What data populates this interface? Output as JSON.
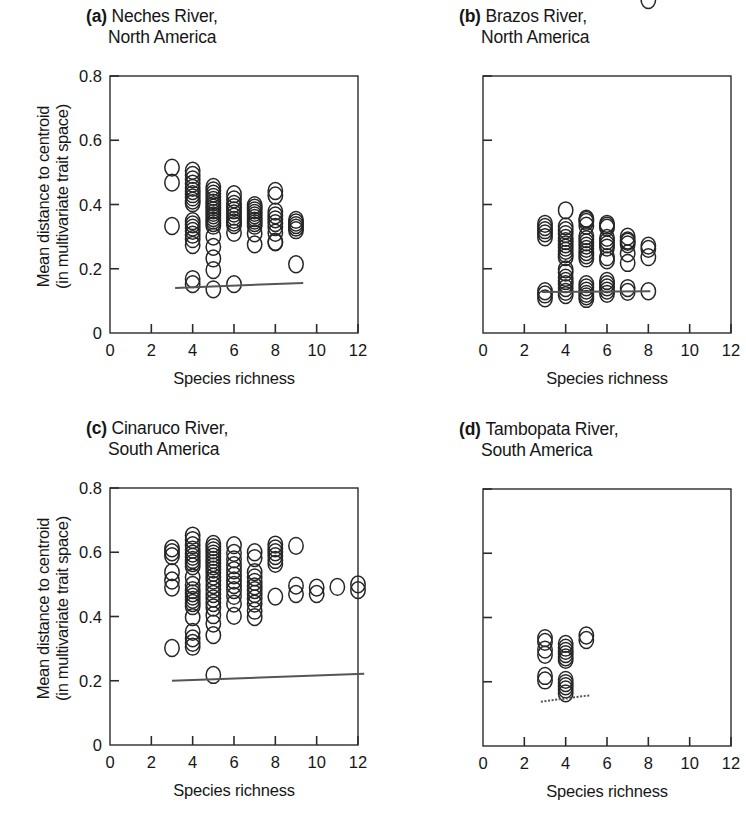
{
  "figure": {
    "width": 746,
    "height": 825,
    "background": "#ffffff",
    "marker": "open-circle",
    "marker_color": "#262626",
    "line_color": "#555555"
  },
  "axes": {
    "x_label": "Species richness",
    "y_label_line1": "Mean distance to centroid",
    "y_label_line2": "(in multivariate trait space)",
    "x_ticks": [
      "0",
      "2",
      "4",
      "6",
      "8",
      "10",
      "12"
    ],
    "x_tick_values": [
      0,
      2,
      4,
      6,
      8,
      10,
      12
    ],
    "y_ticks": [
      "0",
      "0.2",
      "0.4",
      "0.6",
      "0.8"
    ],
    "y_tick_values": [
      0,
      0.2,
      0.4,
      0.6,
      0.8
    ],
    "xlim": [
      0,
      12
    ],
    "ylim": [
      0,
      0.8
    ],
    "grid": false
  },
  "chart_data": [
    {
      "type": "scatter",
      "panel": "a",
      "panel_letter": "(a)",
      "title_line1": "Neches River,",
      "title_line2": "North America",
      "title": "(a) Neches River, North America",
      "xlabel": "Species richness",
      "ylabel": "Mean distance to centroid (in multivariate trait space)",
      "xlim": [
        0,
        12
      ],
      "ylim": [
        0,
        0.8
      ],
      "legend": null,
      "x": [
        3,
        3,
        3,
        4,
        4,
        4,
        4,
        4,
        4,
        4,
        4,
        4,
        4,
        4,
        4,
        4,
        4,
        4,
        4,
        4,
        4,
        4,
        5,
        5,
        5,
        5,
        5,
        5,
        5,
        5,
        5,
        5,
        5,
        5,
        5,
        5,
        5,
        5,
        5,
        5,
        5,
        5,
        6,
        6,
        6,
        6,
        6,
        6,
        6,
        6,
        6,
        6,
        6,
        6,
        7,
        7,
        7,
        7,
        7,
        7,
        7,
        7,
        7,
        7,
        7,
        8,
        8,
        8,
        8,
        8,
        8,
        8,
        8,
        8,
        8,
        9,
        9,
        9,
        9,
        9,
        9
      ],
      "y": [
        0.515,
        0.468,
        0.333,
        0.505,
        0.492,
        0.478,
        0.465,
        0.452,
        0.442,
        0.432,
        0.422,
        0.412,
        0.404,
        0.348,
        0.338,
        0.328,
        0.318,
        0.306,
        0.292,
        0.274,
        0.168,
        0.152,
        0.136,
        0.455,
        0.444,
        0.434,
        0.424,
        0.414,
        0.406,
        0.398,
        0.39,
        0.382,
        0.374,
        0.366,
        0.358,
        0.35,
        0.342,
        0.334,
        0.3,
        0.268,
        0.232,
        0.196,
        0.152,
        0.432,
        0.416,
        0.402,
        0.392,
        0.382,
        0.372,
        0.362,
        0.352,
        0.344,
        0.336,
        0.312,
        0.276,
        0.398,
        0.39,
        0.382,
        0.374,
        0.366,
        0.358,
        0.35,
        0.342,
        0.334,
        0.31,
        0.284,
        0.442,
        0.428,
        0.378,
        0.366,
        0.354,
        0.342,
        0.33,
        0.312,
        0.282,
        0.214,
        0.352,
        0.344,
        0.336,
        0.328,
        0.32,
        0.308
      ],
      "trend_line": {
        "x0": 3.15,
        "y0": 0.14,
        "x1": 9.35,
        "y1": 0.156,
        "style": "solid"
      }
    },
    {
      "type": "scatter",
      "panel": "b",
      "panel_letter": "(b)",
      "title_line1": "Brazos River,",
      "title_line2": "North America",
      "title": "(b) Brazos River, North America",
      "xlabel": "Species richness",
      "ylabel": "Mean distance to centroid (in multivariate trait space)",
      "xlim": [
        0,
        12
      ],
      "ylim": [
        0,
        0.8
      ],
      "legend": null,
      "x": [
        3,
        3,
        3,
        3,
        3,
        3,
        3,
        3,
        4,
        4,
        4,
        4,
        4,
        4,
        4,
        4,
        4,
        4,
        4,
        4,
        4,
        4,
        4,
        4,
        4,
        4,
        4,
        5,
        5,
        5,
        5,
        5,
        5,
        5,
        5,
        5,
        5,
        5,
        5,
        5,
        5,
        5,
        5,
        5,
        5,
        6,
        6,
        6,
        6,
        6,
        6,
        6,
        6,
        6,
        6,
        6,
        6,
        6,
        6,
        7,
        7,
        7,
        7,
        7,
        7,
        7,
        7,
        8,
        8,
        8,
        8,
        8
      ],
      "y": [
        0.34,
        0.33,
        0.32,
        0.31,
        0.298,
        0.13,
        0.12,
        0.108,
        0.382,
        0.332,
        0.32,
        0.308,
        0.296,
        0.286,
        0.276,
        0.266,
        0.256,
        0.246,
        0.236,
        0.198,
        0.188,
        0.172,
        0.162,
        0.152,
        0.14,
        0.128,
        0.118,
        0.356,
        0.346,
        0.334,
        0.302,
        0.292,
        0.282,
        0.272,
        0.262,
        0.252,
        0.242,
        0.232,
        0.152,
        0.142,
        0.132,
        0.122,
        0.114,
        0.106,
        0.352,
        0.34,
        0.328,
        0.296,
        0.286,
        0.276,
        0.266,
        0.236,
        0.226,
        0.162,
        0.152,
        0.142,
        0.132,
        0.122,
        0.334,
        0.3,
        0.288,
        0.276,
        0.248,
        0.218,
        0.14,
        0.128,
        0.284,
        0.272,
        0.262,
        0.236,
        0.13
      ],
      "trend_line": {
        "x0": 2.85,
        "y0": 0.128,
        "x1": 8.1,
        "y1": 0.13,
        "style": "solid"
      }
    },
    {
      "type": "scatter",
      "panel": "c",
      "panel_letter": "(c)",
      "title_line1": "Cinaruco River,",
      "title_line2": "South America",
      "title": "(c) Cinaruco River, South America",
      "xlabel": "Species richness",
      "ylabel": "Mean distance to centroid (in multivariate trait space)",
      "xlim": [
        0,
        12
      ],
      "ylim": [
        0,
        0.8
      ],
      "legend": null,
      "x": [
        3,
        3,
        3,
        3,
        3,
        3,
        3,
        4,
        4,
        4,
        4,
        4,
        4,
        4,
        4,
        4,
        4,
        4,
        4,
        4,
        4,
        4,
        4,
        4,
        4,
        4,
        4,
        4,
        4,
        5,
        5,
        5,
        5,
        5,
        5,
        5,
        5,
        5,
        5,
        5,
        5,
        5,
        5,
        5,
        5,
        5,
        5,
        5,
        5,
        5,
        5,
        6,
        6,
        6,
        6,
        6,
        6,
        6,
        6,
        6,
        6,
        6,
        6,
        7,
        7,
        7,
        7,
        7,
        7,
        7,
        7,
        7,
        7,
        7,
        7,
        8,
        8,
        8,
        8,
        8,
        8,
        8,
        9,
        9,
        9,
        10,
        10,
        11,
        12,
        12
      ],
      "y": [
        0.612,
        0.6,
        0.588,
        0.538,
        0.512,
        0.49,
        0.302,
        0.652,
        0.622,
        0.608,
        0.596,
        0.586,
        0.576,
        0.566,
        0.556,
        0.522,
        0.498,
        0.482,
        0.472,
        0.462,
        0.452,
        0.442,
        0.432,
        0.398,
        0.352,
        0.332,
        0.318,
        0.306,
        0.638,
        0.626,
        0.616,
        0.606,
        0.596,
        0.586,
        0.576,
        0.566,
        0.556,
        0.546,
        0.536,
        0.524,
        0.512,
        0.498,
        0.484,
        0.47,
        0.456,
        0.442,
        0.428,
        0.404,
        0.378,
        0.342,
        0.218,
        0.622,
        0.598,
        0.578,
        0.56,
        0.544,
        0.528,
        0.512,
        0.498,
        0.482,
        0.464,
        0.44,
        0.402,
        0.6,
        0.582,
        0.538,
        0.522,
        0.508,
        0.494,
        0.482,
        0.47,
        0.456,
        0.44,
        0.418,
        0.398,
        0.624,
        0.612,
        0.6,
        0.588,
        0.576,
        0.564,
        0.462,
        0.62,
        0.496,
        0.47,
        0.49,
        0.47,
        0.492,
        0.5,
        0.482
      ],
      "trend_line": {
        "x0": 3.0,
        "y0": 0.2,
        "x1": 12.3,
        "y1": 0.222,
        "style": "solid"
      }
    },
    {
      "type": "scatter",
      "panel": "d",
      "panel_letter": "(d)",
      "title_line1": "Tambopata River,",
      "title_line2": "South America",
      "title": "(d) Tambopata River, South America",
      "xlabel": "Species richness",
      "ylabel": "Mean distance to centroid (in multivariate trait space)",
      "xlim": [
        0,
        12
      ],
      "ylim": [
        0,
        0.8
      ],
      "legend": null,
      "x": [
        3,
        3,
        3,
        3,
        3,
        3,
        4,
        4,
        4,
        4,
        4,
        4,
        4,
        4,
        4,
        4,
        4,
        5,
        5
      ],
      "y": [
        0.336,
        0.324,
        0.3,
        0.284,
        0.218,
        0.204,
        0.318,
        0.306,
        0.296,
        0.286,
        0.276,
        0.268,
        0.206,
        0.196,
        0.186,
        0.176,
        0.164,
        0.344,
        0.33
      ],
      "trend_line": {
        "x0": 2.8,
        "y0": 0.138,
        "x1": 5.2,
        "y1": 0.158,
        "style": "dotted"
      }
    }
  ]
}
